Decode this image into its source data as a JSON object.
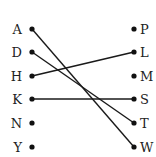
{
  "diagram": {
    "left_items": [
      {
        "label": "A",
        "y": 29
      },
      {
        "label": "D",
        "y": 52
      },
      {
        "label": "H",
        "y": 76
      },
      {
        "label": "K",
        "y": 99
      },
      {
        "label": "N",
        "y": 123
      },
      {
        "label": "Y",
        "y": 147
      }
    ],
    "right_items": [
      {
        "label": "P",
        "y": 29
      },
      {
        "label": "L",
        "y": 52
      },
      {
        "label": "M",
        "y": 76
      },
      {
        "label": "S",
        "y": 99
      },
      {
        "label": "T",
        "y": 123
      },
      {
        "label": "W",
        "y": 147
      }
    ],
    "connections": [
      {
        "from": "A",
        "to": "W"
      },
      {
        "from": "D",
        "to": "T"
      },
      {
        "from": "H",
        "to": "L"
      },
      {
        "from": "K",
        "to": "S"
      }
    ],
    "colors": {
      "line": "#1a1a1a",
      "dot": "#111111",
      "text": "#222222"
    }
  }
}
